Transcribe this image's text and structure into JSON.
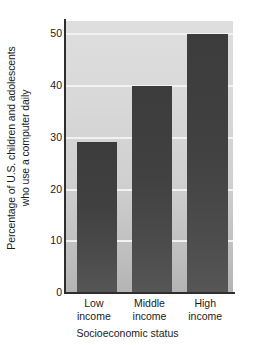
{
  "chart_data": {
    "type": "bar",
    "title": "",
    "subtitle": "",
    "categories": [
      "Low income",
      "Middle income",
      "High income"
    ],
    "category_lines": [
      [
        "Low",
        "income"
      ],
      [
        "Middle",
        "income"
      ],
      [
        "High",
        "income"
      ]
    ],
    "values": [
      29,
      40,
      50
    ],
    "xlabel": "Socioeconomic status",
    "ylabel": "Percentage of U.S. children and adolescents who use a computer daily",
    "ylabel_lines": [
      "Percentage of U.S. children and adolescents",
      "who use a computer daily"
    ],
    "ylim": [
      0,
      52.5
    ],
    "yticks": [
      0,
      10,
      20,
      30,
      40,
      50
    ],
    "ytick_labels": [
      "0",
      "10",
      "20",
      "30",
      "40",
      "50"
    ],
    "grid": "horizontal",
    "legend": "none",
    "colors": {
      "bar": "#414141",
      "plot_background": "#d6d6d6",
      "gridline": "#f2f2f2",
      "axis": "#2e2e2e",
      "text": "#1a1a1a",
      "figure_background": "#ffffff"
    }
  }
}
